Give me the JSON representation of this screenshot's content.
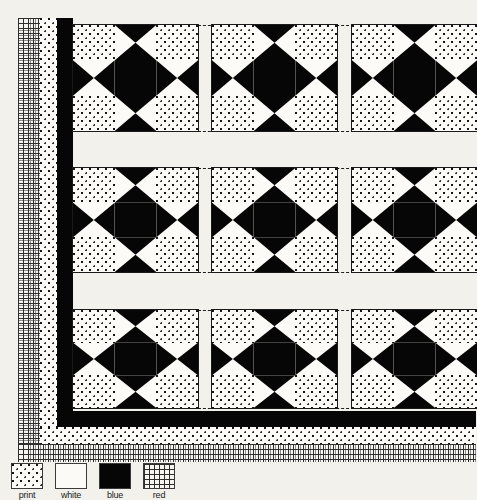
{
  "diagram": {
    "background_color": "#f2f1ec",
    "ink_color": "#060606"
  },
  "quilt": {
    "block_name": "Ohio Star",
    "rows": 3,
    "columns": 3,
    "blocks_visible": 9,
    "block_grid": "3x3",
    "sashing_style": "dashed",
    "sashing_label": "sashing-guide-line",
    "block_layout": [
      [
        "corner-print",
        "point-blue-white",
        "corner-print"
      ],
      [
        "point-blue-white",
        "center-blue",
        "point-blue-white"
      ],
      [
        "corner-print",
        "point-blue-white",
        "corner-print"
      ]
    ]
  },
  "borders": [
    {
      "name": "inner-border",
      "fabric": "blue",
      "color": "#060606"
    },
    {
      "name": "middle-border",
      "fabric": "print",
      "color": "#fcfbf7"
    },
    {
      "name": "outer-border",
      "fabric": "red",
      "color": "#f6f5f0"
    }
  ],
  "legend": {
    "name": "fabric-key",
    "items": [
      {
        "label": "print",
        "fabric": "print",
        "swatch": "stipple-dot-texture"
      },
      {
        "label": "white",
        "fabric": "white",
        "swatch": "solid-white"
      },
      {
        "label": "blue",
        "fabric": "blue",
        "swatch": "solid-black"
      },
      {
        "label": "red",
        "fabric": "red",
        "swatch": "crosshatch-grid-texture"
      }
    ]
  }
}
